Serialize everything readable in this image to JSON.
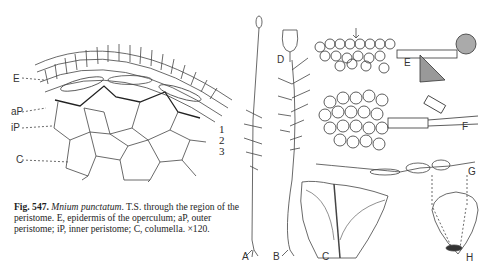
{
  "figure": {
    "number_label": "Fig. 547.",
    "species": "Mnium punctatum",
    "caption_rest": ". T.S. through the region of the peristome. E, epidermis of the operculum; aP, outer peristome; iP, inner peristome; C, columella. ×120."
  },
  "left_panel": {
    "labels": {
      "E": "E",
      "aP": "aP",
      "iP": "iP",
      "C": "C"
    },
    "layers": [
      "1",
      "2",
      "3"
    ]
  },
  "right_panel": {
    "subfigure_labels": {
      "A": "A",
      "B": "B",
      "C": "C",
      "D": "D",
      "E": "E",
      "F": "F",
      "G": "G",
      "H": "H"
    }
  }
}
